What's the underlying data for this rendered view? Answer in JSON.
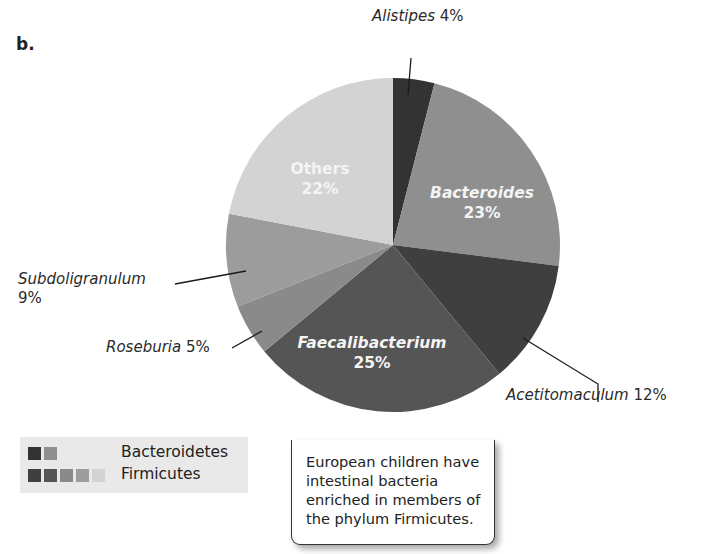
{
  "panel_label": "b.",
  "chart_data": {
    "type": "pie",
    "title": "",
    "start_angle_deg": 0,
    "direction": "clockwise",
    "slices": [
      {
        "label": "Alistipes",
        "value": 4,
        "phylum": "Bacteroidetes",
        "color": "#333333",
        "label_position": "outside"
      },
      {
        "label": "Bacteroides",
        "value": 23,
        "phylum": "Bacteroidetes",
        "color": "#8f8f8f",
        "label_position": "inside"
      },
      {
        "label": "Acetitomaculum",
        "value": 12,
        "phylum": "Firmicutes",
        "color": "#3f3f3f",
        "label_position": "outside"
      },
      {
        "label": "Faecalibacterium",
        "value": 25,
        "phylum": "Firmicutes",
        "color": "#555555",
        "label_position": "inside"
      },
      {
        "label": "Roseburia",
        "value": 5,
        "phylum": "Firmicutes",
        "color": "#8a8a8a",
        "label_position": "outside"
      },
      {
        "label": "Subdoligranulum",
        "value": 9,
        "phylum": "Firmicutes",
        "color": "#9c9c9c",
        "label_position": "outside"
      },
      {
        "label": "Others",
        "value": 22,
        "phylum": "Firmicutes",
        "color": "#d3d3d3",
        "label_position": "inside"
      }
    ],
    "legend": {
      "position": "bottom-left",
      "entries": [
        {
          "label": "Bacteroidetes",
          "swatches": [
            "#333333",
            "#8f8f8f"
          ]
        },
        {
          "label": "Firmicutes",
          "swatches": [
            "#3f3f3f",
            "#555555",
            "#8a8a8a",
            "#9c9c9c",
            "#d3d3d3"
          ]
        }
      ]
    }
  },
  "labels": {
    "alistipes": {
      "name": "Alistipes",
      "pct": "4%"
    },
    "bacteroides": {
      "name": "Bacteroides",
      "pct": "23%"
    },
    "acetitomaculum": {
      "name": "Acetitomaculum",
      "pct": "12%"
    },
    "faecalibacterium": {
      "name": "Faecalibacterium",
      "pct": "25%"
    },
    "roseburia": {
      "name": "Roseburia",
      "pct": "5%"
    },
    "subdoligranulum": {
      "name": "Subdoligranulum",
      "pct": "9%"
    },
    "others": {
      "name": "Others",
      "pct": "22%"
    }
  },
  "legend": {
    "bacteroidetes": "Bacteroidetes",
    "firmicutes": "Firmicutes"
  },
  "callout": {
    "text": "European children have intestinal bacteria enriched in members of the phylum Firmicutes."
  }
}
